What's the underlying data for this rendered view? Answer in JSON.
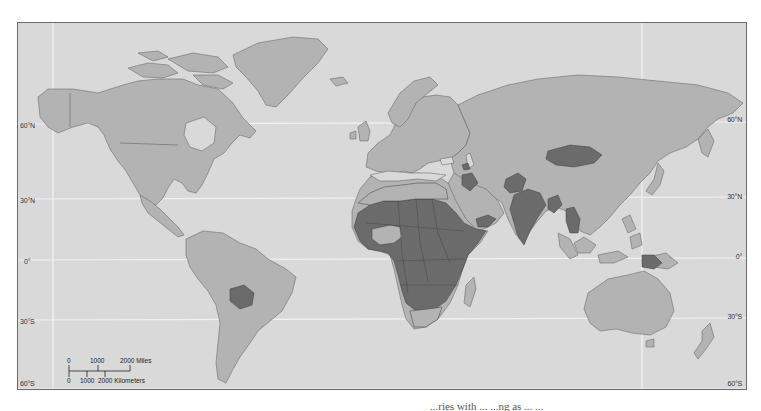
{
  "map": {
    "type": "world-choropleth",
    "projection": "Robinson-like",
    "colors": {
      "ocean": "#d9d9d9",
      "land": "#b3b3b3",
      "highlight": "#6b6b6b",
      "border": "#5a5a5a",
      "graticule": "#f2f2f2"
    },
    "latitude_labels_left": [
      "60°N",
      "30°N",
      "0°",
      "30°S",
      "60°S"
    ],
    "latitude_labels_right": [
      "60°N",
      "30°N",
      "0°",
      "30°S",
      "60°S"
    ],
    "highlighted_regions": [
      "Sub-Saharan Africa",
      "Yemen",
      "Iraq",
      "Armenia",
      "Afghanistan",
      "India",
      "Bangladesh",
      "Mongolia",
      "Laos",
      "Cambodia",
      "Papua New Guinea",
      "Bolivia"
    ],
    "scale_bar": {
      "miles_labels": [
        "0",
        "1000",
        "2000 Miles"
      ],
      "km_labels": [
        "0",
        "1000",
        "2000 Kilometers"
      ]
    }
  },
  "caption": {
    "text": "...ries with ... ...ng as ... ..."
  }
}
